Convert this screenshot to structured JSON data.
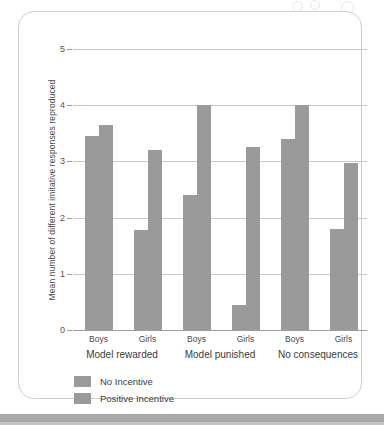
{
  "chart_data": {
    "type": "bar",
    "title": "",
    "xlabel": "",
    "ylabel": "Mean number of different imitative responses reproduced",
    "ylim": [
      0,
      5
    ],
    "yticks": [
      0,
      1,
      2,
      3,
      4,
      5
    ],
    "ytick_labels": [
      "0",
      "1",
      "2",
      "3",
      "4",
      "5"
    ],
    "grid": true,
    "legend_position": "bottom-left",
    "groups": [
      "Model rewarded",
      "Model punished",
      "No consequences"
    ],
    "subgroups": [
      "Boys",
      "Girls"
    ],
    "categories": [
      "Model rewarded - Boys",
      "Model rewarded - Girls",
      "Model punished - Boys",
      "Model punished - Girls",
      "No consequences - Boys",
      "No consequences - Girls"
    ],
    "series": [
      {
        "name": "No Incentive",
        "color": "#9a9a9a",
        "values": [
          3.45,
          1.78,
          2.4,
          0.45,
          3.4,
          1.8
        ]
      },
      {
        "name": "Positive Incentive",
        "color": "#9a9a9a",
        "values": [
          3.65,
          3.2,
          4.0,
          3.25,
          4.0,
          2.98
        ]
      }
    ]
  },
  "legend": {
    "items": [
      {
        "label": "No Incentive"
      },
      {
        "label": "Positive Incentive"
      }
    ]
  },
  "colors": {
    "bar": "#9a9a9a",
    "gridline": "#c8c8c8",
    "axis": "#9e9e9e",
    "card_border": "#cfcfcf",
    "bottom_band": "#a9a9a9",
    "text": "#3b3b3b"
  }
}
